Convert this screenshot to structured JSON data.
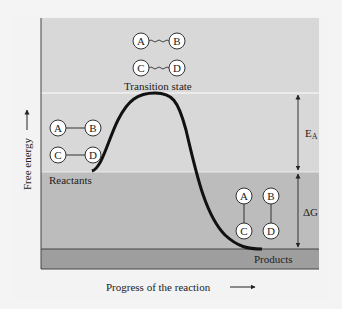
{
  "diagram": {
    "axis": {
      "y_label": "Free energy",
      "x_label": "Progress of the reaction"
    },
    "levels": {
      "transition_state": {
        "label": "Transition state",
        "y": 93
      },
      "reactants": {
        "label": "Reactants",
        "y": 172
      },
      "products": {
        "label": "Products",
        "y": 249
      }
    },
    "annotations": {
      "activation_energy": {
        "label": "E",
        "subscript": "A"
      },
      "delta_g": {
        "label": "ΔG"
      }
    },
    "molecules": {
      "reactants": {
        "top": [
          "A",
          "B"
        ],
        "bottom": [
          "C",
          "D"
        ],
        "bond": "horizontal-solid"
      },
      "transition_state": {
        "top": [
          "A",
          "B"
        ],
        "bottom": [
          "C",
          "D"
        ],
        "bond": "horizontal-wavy"
      },
      "products": {
        "left": [
          "A",
          "C"
        ],
        "right": [
          "B",
          "D"
        ],
        "bond": "vertical-solid"
      }
    },
    "colors": {
      "background": "#f3f3f3",
      "upper_band": "#d9d9d9",
      "middle_band": "#bdbdbd",
      "bottom_band": "#9e9e9e",
      "curve": "#111111",
      "divider": "#f5f5f5"
    }
  }
}
